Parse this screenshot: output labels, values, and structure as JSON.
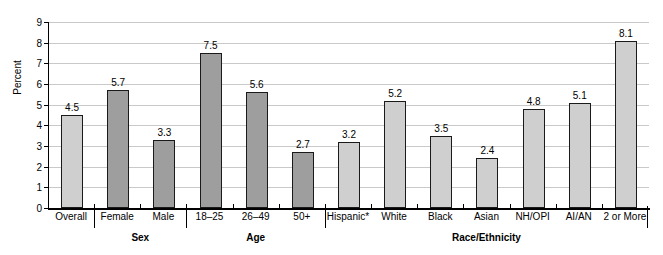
{
  "chart_data": {
    "type": "bar",
    "title": "",
    "subtitle": "",
    "xlabel": "",
    "ylabel": "Percent",
    "ylim": [
      0,
      9
    ],
    "yticks": [
      "0",
      "1",
      "2",
      "3",
      "4",
      "5",
      "6",
      "7",
      "8",
      "9"
    ],
    "grid": true,
    "legend": "none",
    "categories": [
      "Overall",
      "Female",
      "Male",
      "18–25",
      "26–49",
      "50+",
      "Hispanic*",
      "White",
      "Black",
      "Asian",
      "NH/OPI",
      "AI/AN",
      "2 or More"
    ],
    "values": [
      4.5,
      5.7,
      3.3,
      7.5,
      5.6,
      2.7,
      3.2,
      5.2,
      3.5,
      2.4,
      4.8,
      5.1,
      8.1
    ],
    "value_labels": [
      "4.5",
      "5.7",
      "3.3",
      "7.5",
      "5.6",
      "2.7",
      "3.2",
      "5.2",
      "3.5",
      "2.4",
      "4.8",
      "5.1",
      "8.1"
    ],
    "bar_shades": [
      "light",
      "dark",
      "dark",
      "dark",
      "dark",
      "dark",
      "light",
      "light",
      "light",
      "light",
      "light",
      "light",
      "light"
    ],
    "groups": [
      {
        "label": "",
        "start": 0,
        "end": 0
      },
      {
        "label": "Sex",
        "start": 1,
        "end": 2
      },
      {
        "label": "Age",
        "start": 3,
        "end": 5
      },
      {
        "label": "Race/Ethnicity",
        "start": 6,
        "end": 12
      }
    ],
    "colors": {
      "bar_light": "#cfcfcf",
      "bar_dark": "#9e9e9e",
      "bar_border": "#1a1a1a",
      "gridline": "#c9c9c9",
      "axis": "#000000",
      "background": "#ffffff",
      "text": "#000000"
    }
  }
}
